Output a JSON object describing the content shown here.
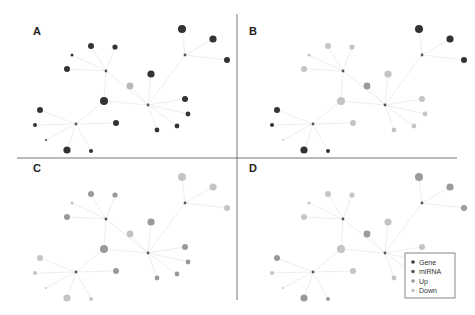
{
  "figure": {
    "panels": [
      "A",
      "B",
      "C",
      "D"
    ],
    "legend": {
      "items": [
        {
          "label": "Gene",
          "color": "#3a3a3a"
        },
        {
          "label": "miRNA",
          "color": "#555555"
        },
        {
          "label": "Up",
          "color": "#9a9a9a"
        },
        {
          "label": "Down",
          "color": "#c4c4c4"
        }
      ]
    },
    "colors": {
      "dark": "#333333",
      "hub": "#555555",
      "up": "#9a9a9a",
      "down": "#c4c4c4",
      "edge": "#e6e6e6",
      "divider": "#555555"
    }
  },
  "network": {
    "hubs": [
      [
        106,
        71
      ],
      [
        185,
        55
      ],
      [
        148,
        105
      ],
      [
        76,
        124
      ]
    ],
    "hub_edges": [
      [
        0,
        2
      ],
      [
        1,
        2
      ]
    ],
    "nodes": [
      {
        "x": 91,
        "y": 46,
        "r": 3,
        "hub": 0
      },
      {
        "x": 115,
        "y": 47,
        "r": 2.6,
        "hub": 0
      },
      {
        "x": 72,
        "y": 55,
        "r": 1.5,
        "hub": 0
      },
      {
        "x": 67,
        "y": 69,
        "r": 3,
        "hub": 0
      },
      {
        "x": 151,
        "y": 74,
        "r": 3.6,
        "hub": 2
      },
      {
        "x": 130,
        "y": 86,
        "r": 3.4,
        "hub": 2
      },
      {
        "x": 104,
        "y": 101,
        "r": 4,
        "hub": 2
      },
      {
        "x": 182,
        "y": 29,
        "r": 4,
        "hub": 1
      },
      {
        "x": 213,
        "y": 39,
        "r": 3.6,
        "hub": 1
      },
      {
        "x": 227,
        "y": 60,
        "r": 3,
        "hub": 1
      },
      {
        "x": 185,
        "y": 99,
        "r": 3,
        "hub": 2
      },
      {
        "x": 188,
        "y": 114,
        "r": 2.4,
        "hub": 2
      },
      {
        "x": 40,
        "y": 110,
        "r": 3,
        "hub": 3
      },
      {
        "x": 35,
        "y": 125,
        "r": 2,
        "hub": 3
      },
      {
        "x": 46,
        "y": 140,
        "r": 1,
        "hub": 3
      },
      {
        "x": 67,
        "y": 150,
        "r": 3.6,
        "hub": 3
      },
      {
        "x": 91,
        "y": 151,
        "r": 2,
        "hub": 3
      },
      {
        "x": 116,
        "y": 123,
        "r": 3,
        "hub": 3
      },
      {
        "x": 157,
        "y": 130,
        "r": 2.4,
        "hub": 2
      },
      {
        "x": 177,
        "y": 126,
        "r": 2.4,
        "hub": 2
      }
    ],
    "extra_edges": [
      [
        6,
        3
      ],
      [
        6,
        0
      ]
    ]
  },
  "panel_styles": {
    "A": {
      "ox": 0,
      "oy": 0,
      "label_x": 33,
      "label_y": 35,
      "fills": [
        "#333",
        "#333",
        "#333",
        "#333",
        "#333",
        "#b8b8b8",
        "#333",
        "#333",
        "#333",
        "#333",
        "#333",
        "#333",
        "#333",
        "#333",
        "#333",
        "#333",
        "#333",
        "#333",
        "#333",
        "#333"
      ]
    },
    "B": {
      "ox": 237,
      "oy": 0,
      "label_x": 12,
      "label_y": 35,
      "fills": [
        "#c4c4c4",
        "#c4c4c4",
        "#c4c4c4",
        "#c4c4c4",
        "#c4c4c4",
        "#9a9a9a",
        "#c4c4c4",
        "#333",
        "#333",
        "#333",
        "#c4c4c4",
        "#c4c4c4",
        "#333",
        "#333",
        "#c4c4c4",
        "#333",
        "#333",
        "#c4c4c4",
        "#c4c4c4",
        "#c4c4c4"
      ]
    },
    "C": {
      "ox": 0,
      "oy": 148,
      "label_x": 33,
      "label_y": 24,
      "fills": [
        "#9a9a9a",
        "#9a9a9a",
        "#c4c4c4",
        "#9a9a9a",
        "#9a9a9a",
        "#c4c4c4",
        "#9a9a9a",
        "#c4c4c4",
        "#c4c4c4",
        "#c4c4c4",
        "#9a9a9a",
        "#9a9a9a",
        "#c4c4c4",
        "#c4c4c4",
        "#c4c4c4",
        "#c4c4c4",
        "#c4c4c4",
        "#9a9a9a",
        "#9a9a9a",
        "#9a9a9a"
      ]
    },
    "D": {
      "ox": 237,
      "oy": 148,
      "label_x": 12,
      "label_y": 24,
      "fills": [
        "#c4c4c4",
        "#c4c4c4",
        "#c4c4c4",
        "#c4c4c4",
        "#c4c4c4",
        "#9a9a9a",
        "#c4c4c4",
        "#9a9a9a",
        "#9a9a9a",
        "#9a9a9a",
        "#c4c4c4",
        "#c4c4c4",
        "#9a9a9a",
        "#c4c4c4",
        "#c4c4c4",
        "#9a9a9a",
        "#9a9a9a",
        "#c4c4c4",
        "#c4c4c4",
        "#c4c4c4"
      ]
    }
  }
}
